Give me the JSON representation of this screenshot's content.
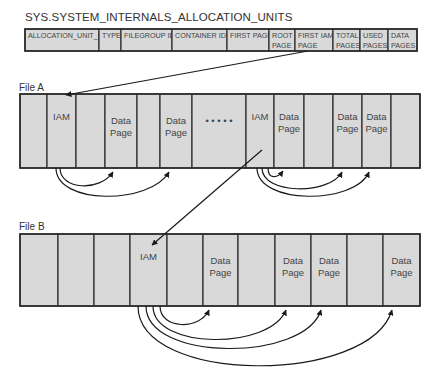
{
  "title": "SYS.SYSTEM_INTERNALS_ALLOCATION_UNITS",
  "table_columns": [
    {
      "lines": [
        "ALLOCATION_UNIT_ID"
      ]
    },
    {
      "lines": [
        "TYPE"
      ]
    },
    {
      "lines": [
        "FILEGROUP ID"
      ]
    },
    {
      "lines": [
        "CONTAINER ID"
      ]
    },
    {
      "lines": [
        "FIRST PAGE"
      ]
    },
    {
      "lines": [
        "ROOT",
        "PAGE"
      ]
    },
    {
      "lines": [
        "FIRST IAM",
        "PAGE"
      ]
    },
    {
      "lines": [
        "TOTAL",
        "PAGES"
      ]
    },
    {
      "lines": [
        "USED",
        "PAGES"
      ]
    },
    {
      "lines": [
        "DATA",
        "PAGES"
      ]
    }
  ],
  "files": [
    {
      "label": "File A",
      "pages": [
        {
          "lines": []
        },
        {
          "lines": [
            "IAM"
          ],
          "top": true
        },
        {
          "lines": []
        },
        {
          "lines": [
            "Data",
            "Page"
          ]
        },
        {
          "lines": []
        },
        {
          "lines": [
            "Data",
            "Page"
          ]
        },
        {
          "lines": [
            "• • • • •"
          ]
        },
        {
          "lines": [
            "IAM"
          ],
          "top": true
        },
        {
          "lines": [
            "Data",
            "Page"
          ],
          "top": true
        },
        {
          "lines": []
        },
        {
          "lines": [
            "Data",
            "Page"
          ],
          "top": true
        },
        {
          "lines": [
            "Data",
            "Page"
          ],
          "top": true
        },
        {
          "lines": []
        }
      ]
    },
    {
      "label": "File B",
      "pages": [
        {
          "lines": []
        },
        {
          "lines": []
        },
        {
          "lines": []
        },
        {
          "lines": [
            "IAM"
          ],
          "top": true
        },
        {
          "lines": []
        },
        {
          "lines": [
            "Data",
            "Page"
          ]
        },
        {
          "lines": []
        },
        {
          "lines": [
            "Data",
            "Page"
          ]
        },
        {
          "lines": [
            "Data",
            "Page"
          ]
        },
        {
          "lines": []
        },
        {
          "lines": [
            "Data",
            "Page"
          ]
        }
      ]
    }
  ],
  "colors": {
    "cell_fill": "#d9d9d9",
    "border": "#2b2b2b",
    "arrow": "#1a1a1a"
  }
}
